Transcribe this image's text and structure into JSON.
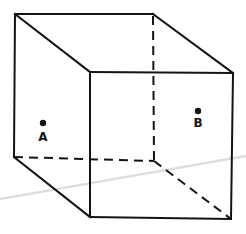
{
  "figure": {
    "width": 246,
    "height": 234,
    "background_color": "#ffffff",
    "stroke_color": "#141414",
    "stroke_width": 2,
    "dash_pattern": "9 6",
    "artifact_color": "#dfdfda",
    "artifact_width": 2.5,
    "artifact_line": {
      "name": "scan-crease-line",
      "x1": 0,
      "y1": 199,
      "x2": 246,
      "y2": 156
    },
    "edges": [
      {
        "name": "edge-top-back",
        "style": "solid",
        "x1": 15,
        "y1": 14,
        "x2": 153,
        "y2": 14
      },
      {
        "name": "edge-back-left-vertical",
        "style": "solid",
        "x1": 15,
        "y1": 14,
        "x2": 14,
        "y2": 157
      },
      {
        "name": "edge-top-left-oblique",
        "style": "solid",
        "x1": 15,
        "y1": 14,
        "x2": 90,
        "y2": 72
      },
      {
        "name": "edge-top-right-oblique",
        "style": "solid",
        "x1": 153,
        "y1": 14,
        "x2": 233,
        "y2": 73
      },
      {
        "name": "edge-front-top",
        "style": "solid",
        "x1": 90,
        "y1": 72,
        "x2": 233,
        "y2": 73
      },
      {
        "name": "edge-front-left-vertical",
        "style": "solid",
        "x1": 90,
        "y1": 72,
        "x2": 90,
        "y2": 217
      },
      {
        "name": "edge-front-right-vertical",
        "style": "solid",
        "x1": 233,
        "y1": 73,
        "x2": 231,
        "y2": 219
      },
      {
        "name": "edge-front-bottom",
        "style": "solid",
        "x1": 90,
        "y1": 217,
        "x2": 231,
        "y2": 219
      },
      {
        "name": "edge-bottom-left-oblique",
        "style": "solid",
        "x1": 14,
        "y1": 157,
        "x2": 90,
        "y2": 217
      },
      {
        "name": "edge-back-right-vertical-hidden",
        "style": "dashed",
        "x1": 153,
        "y1": 16,
        "x2": 154,
        "y2": 161
      },
      {
        "name": "edge-bottom-back-hidden",
        "style": "dashed",
        "x1": 14,
        "y1": 157,
        "x2": 154,
        "y2": 161
      },
      {
        "name": "edge-bottom-right-oblique-hidden",
        "style": "dashed",
        "x1": 154,
        "y1": 161,
        "x2": 231,
        "y2": 219
      }
    ],
    "dot_radius": 3.2,
    "points": [
      {
        "label": "A",
        "dot_x": 43,
        "dot_y": 123,
        "label_x": 43,
        "label_y": 141
      },
      {
        "label": "B",
        "dot_x": 198,
        "dot_y": 111,
        "label_x": 198,
        "label_y": 127
      }
    ]
  }
}
